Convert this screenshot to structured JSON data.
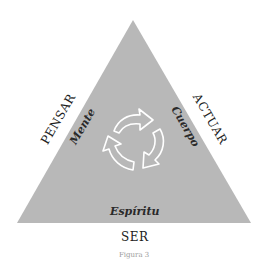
{
  "diagram": {
    "outer_labels": {
      "left": "PENSAR",
      "right": "ACTUAR",
      "bottom": "SER"
    },
    "inner_labels": {
      "left": "Mente",
      "right": "Cuerpo",
      "bottom": "Espíritu"
    },
    "center_icon": "recycle-cycle-arrows-icon",
    "caption": "Figura 3",
    "colors": {
      "triangle_fill": "#b8b8b8",
      "arrow_stroke": "#ffffff",
      "text": "#222222",
      "caption": "#9a9a9a"
    }
  }
}
